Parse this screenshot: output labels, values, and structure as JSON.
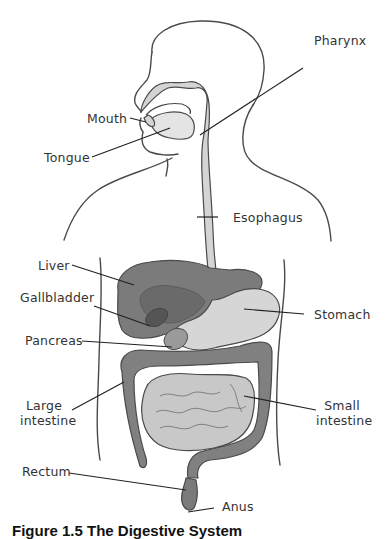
{
  "figure": {
    "title": "The Digestive System",
    "caption": "Figure 1.5 The Digestive System",
    "colors": {
      "outline": "#4a4a4a",
      "light_organ": "#d9d9d9",
      "mid_organ": "#8f8f8f",
      "dark_organ": "#6d6d6d",
      "leader_line": "#222222"
    },
    "labels": [
      {
        "id": "pharynx",
        "text": "Pharynx",
        "side": "right"
      },
      {
        "id": "mouth",
        "text": "Mouth",
        "side": "left"
      },
      {
        "id": "tongue",
        "text": "Tongue",
        "side": "left"
      },
      {
        "id": "esophagus",
        "text": "Esophagus",
        "side": "right"
      },
      {
        "id": "liver",
        "text": "Liver",
        "side": "left"
      },
      {
        "id": "gallbladder",
        "text": "Gallbladder",
        "side": "left"
      },
      {
        "id": "stomach",
        "text": "Stomach",
        "side": "right"
      },
      {
        "id": "pancreas",
        "text": "Pancreas",
        "side": "left"
      },
      {
        "id": "large_intestine",
        "text": "Large intestine",
        "line1": "Large",
        "line2": "intestine",
        "side": "left"
      },
      {
        "id": "small_intestine",
        "text": "Small intestine",
        "line1": "Small",
        "line2": "intestine",
        "side": "right"
      },
      {
        "id": "rectum",
        "text": "Rectum",
        "side": "left"
      },
      {
        "id": "anus",
        "text": "Anus",
        "side": "right"
      }
    ]
  }
}
